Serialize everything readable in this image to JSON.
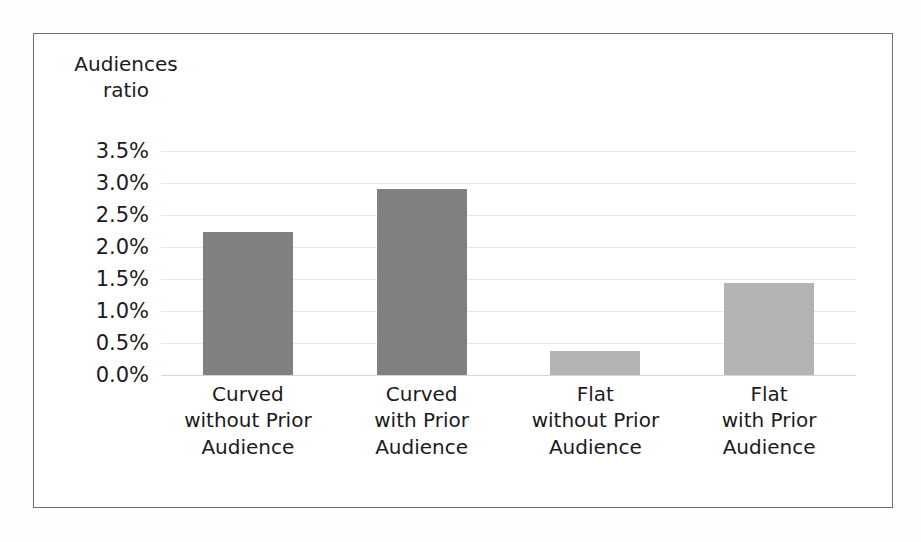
{
  "chart_data": {
    "type": "bar",
    "title": "",
    "subtitle": "",
    "ylabel": "Audiences\nratio",
    "xlabel": "",
    "categories": [
      "Curved\nwithout Prior\nAudience",
      "Curved\nwith Prior\nAudience",
      "Flat\nwithout Prior\nAudience",
      "Flat\nwith Prior\nAudience"
    ],
    "values": [
      2.23,
      2.9,
      0.37,
      1.43
    ],
    "value_labels": [
      "2.23%",
      "2.90%",
      "0.37%",
      "1.43%"
    ],
    "ylim": [
      0,
      3.5
    ],
    "ytick_values": [
      3.5,
      3.0,
      2.5,
      2.0,
      1.5,
      1.0,
      0.5,
      0.0
    ],
    "ytick_labels": [
      "3.5%",
      "3.0%",
      "2.5%",
      "2.0%",
      "1.5%",
      "1.0%",
      "0.5%",
      "0.0%"
    ],
    "grid": true,
    "legend": false,
    "legend_position": "none",
    "bar_colors": [
      "#808080",
      "#808080",
      "#b3b3b3",
      "#b3b3b3"
    ],
    "series": [
      {
        "name": "Audiences ratio",
        "values": [
          2.23,
          2.9,
          0.37,
          1.43
        ]
      }
    ]
  },
  "colors": {
    "bar_dark": "#808080",
    "bar_light": "#b3b3b3",
    "gridline": "#e4e6e8",
    "frame_border": "#6e6e6e",
    "text": "#1b1b1b",
    "background": "#ffffff"
  }
}
